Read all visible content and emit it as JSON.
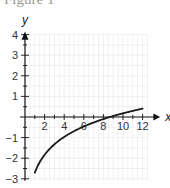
{
  "figure": {
    "title": "Figure 1"
  },
  "chart_data": {
    "type": "line",
    "title": "Figure 1",
    "xlabel": "x",
    "ylabel": "y",
    "xlim": [
      0,
      12.5
    ],
    "ylim": [
      -3,
      4
    ],
    "grid": true,
    "x_ticks": [
      2,
      4,
      6,
      8,
      10,
      12
    ],
    "y_ticks": [
      4,
      3,
      2,
      1,
      -1,
      -2,
      -3
    ],
    "series": [
      {
        "name": "curve",
        "x": [
          1,
          1.5,
          2,
          3,
          4,
          5,
          6,
          7,
          8,
          9,
          10,
          11,
          12
        ],
        "y": [
          -2.7,
          -2.19,
          -1.83,
          -1.33,
          -0.97,
          -0.69,
          -0.46,
          -0.27,
          -0.1,
          0.05,
          0.18,
          0.3,
          0.4
        ]
      }
    ],
    "x_intercept": 9.5
  },
  "colors": {
    "grid": "#e6e6e6",
    "axis": "#111111",
    "curve": "#1a1a1a"
  }
}
